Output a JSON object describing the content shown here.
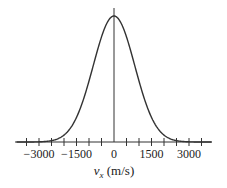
{
  "chart_data": {
    "type": "line",
    "title": "",
    "xlabel_var": "v",
    "xlabel_sub": "x",
    "xlabel_units": " (m/s)",
    "xlabel": "v_x (m/s)",
    "ylabel": "",
    "xlim": [
      -3900,
      3900
    ],
    "x_tick_labels": [
      "−3000",
      "−1500",
      "0",
      "1500",
      "3000"
    ],
    "x_tick_label_values": [
      -3000,
      -1500,
      0,
      1500,
      3000
    ],
    "x_minor_tick_step": 500,
    "grid": false,
    "legend": null,
    "series": [
      {
        "name": "Maxwell velocity distribution (Gaussian)",
        "description": "Bell-shaped curve centered at v_x = 0, falling to near zero around ±2500 m/s",
        "center": 0,
        "sigma_approx": 830,
        "x": [
          -3000,
          -2500,
          -2000,
          -1500,
          -1000,
          -500,
          0,
          500,
          1000,
          1500,
          2000,
          2500,
          3000
        ],
        "values": [
          0.001,
          0.011,
          0.055,
          0.195,
          0.485,
          0.834,
          1.0,
          0.834,
          0.485,
          0.195,
          0.055,
          0.011,
          0.001
        ]
      }
    ],
    "colors": {
      "curve": "#333333",
      "axis": "#333333"
    }
  }
}
